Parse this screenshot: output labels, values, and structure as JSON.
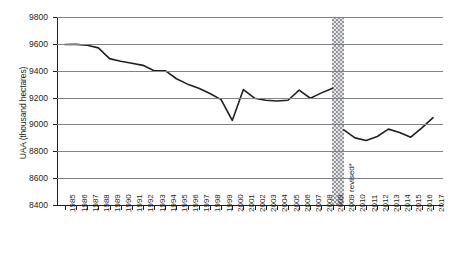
{
  "chart_data": {
    "type": "line",
    "title": "",
    "xlabel": "",
    "ylabel": "UAA (thousand hectares)",
    "ylim": [
      8400,
      9800
    ],
    "ytick_step": 200,
    "yticks": [
      8400,
      8600,
      8800,
      9000,
      9200,
      9400,
      9600,
      9800
    ],
    "grid": true,
    "legend": "none",
    "axis_break": {
      "label": "2009 revised*",
      "after_category": "2009",
      "style": "hatched-vertical-band",
      "color": "#939598"
    },
    "categories": [
      "1985",
      "1986",
      "1987",
      "1988",
      "1989",
      "1990",
      "1991",
      "1992",
      "1993",
      "1994",
      "1995",
      "1996",
      "1997",
      "1998",
      "1999",
      "2000",
      "2001",
      "2002",
      "2003",
      "2004",
      "2005",
      "2006",
      "2007",
      "2008",
      "2009",
      "2009 revised*",
      "2010",
      "2011",
      "2012",
      "2013",
      "2014",
      "2015",
      "2016",
      "2017"
    ],
    "series": [
      {
        "name": "UAA",
        "values": [
          9595,
          9596,
          9590,
          9570,
          9490,
          9470,
          9455,
          9440,
          9400,
          9400,
          9340,
          9300,
          9270,
          9230,
          9185,
          9030,
          9260,
          9195,
          9180,
          9175,
          9180,
          9255,
          9195,
          9235,
          9270,
          8960,
          8900,
          8880,
          8910,
          8965,
          8940,
          8905,
          8975,
          9050
        ]
      }
    ],
    "footnote_marker": "*"
  },
  "yaxis": {
    "title": "UAA (thousand hectares)",
    "ticks": [
      "9800",
      "9600",
      "9400",
      "9200",
      "9000",
      "8800",
      "8600",
      "8400"
    ]
  }
}
